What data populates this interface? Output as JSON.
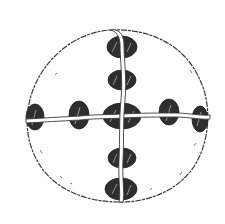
{
  "figure": {
    "colors": {
      "background": "#ffffff",
      "outline": "#3a3a3a",
      "stud_fill": "#2e2e2e",
      "cord_fill": "#ffffff"
    },
    "disc": {
      "cx": 118,
      "cy": 118,
      "rx": 92,
      "ry": 88
    },
    "vertical_studs": [
      {
        "cx": 122,
        "cy": 47,
        "rx": 15,
        "ry": 11
      },
      {
        "cx": 122,
        "cy": 80,
        "rx": 14,
        "ry": 10
      },
      {
        "cx": 122,
        "cy": 116,
        "rx": 19,
        "ry": 13
      },
      {
        "cx": 122,
        "cy": 158,
        "rx": 14,
        "ry": 10
      },
      {
        "cx": 121,
        "cy": 189,
        "rx": 16,
        "ry": 11
      }
    ],
    "horizontal_studs": [
      {
        "cx": 35,
        "cy": 117,
        "rx": 9,
        "ry": 13
      },
      {
        "cx": 79,
        "cy": 115,
        "rx": 10,
        "ry": 14
      },
      {
        "cx": 169,
        "cy": 112,
        "rx": 10,
        "ry": 13
      },
      {
        "cx": 200,
        "cy": 119,
        "rx": 8,
        "ry": 13
      }
    ]
  }
}
